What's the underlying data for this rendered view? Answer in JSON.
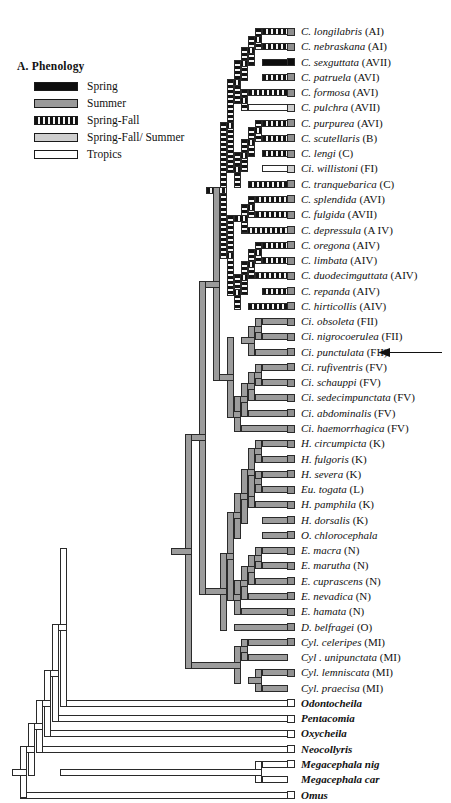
{
  "figure": {
    "panel_label": "A. Phenology"
  },
  "legend": {
    "title": "A. Phenology",
    "items": [
      {
        "label": "Spring",
        "key": "spring",
        "color": "#0d0d0d"
      },
      {
        "label": "Summer",
        "key": "summer",
        "color": "#9a9a9a"
      },
      {
        "label": "Spring-Fall",
        "key": "sf",
        "color": "#111111"
      },
      {
        "label": "Spring-Fall/ Summer",
        "key": "sfs",
        "color": "#cfcfcf"
      },
      {
        "label": "Tropics",
        "key": "trop",
        "color": "#ffffff"
      }
    ]
  },
  "annotation": {
    "arrow_target": "Ci. punctulata (FII)",
    "arrow_icon": "left-arrow-icon"
  },
  "chart_data": {
    "type": "tree",
    "title": "A. Phenology",
    "states": [
      "Spring",
      "Summer",
      "Spring-Fall",
      "Spring-Fall/ Summer",
      "Tropics"
    ],
    "taxa": [
      {
        "genus": "C.",
        "species": "longilabris",
        "code": "(AI)",
        "box": "summer",
        "bold": false
      },
      {
        "genus": "C.",
        "species": "nebraskana",
        "code": "(AI)",
        "box": "summer",
        "bold": false
      },
      {
        "genus": "C.",
        "species": "sexguttata",
        "code": "(AVII)",
        "box": "spring",
        "bold": false
      },
      {
        "genus": "C.",
        "species": "patruela",
        "code": "(AVI)",
        "box": "summer",
        "bold": false
      },
      {
        "genus": "C.",
        "species": "formosa",
        "code": "(AVI)",
        "box": "summer",
        "bold": false
      },
      {
        "genus": "C.",
        "species": "pulchra",
        "code": "(AVII)",
        "box": "sfs",
        "bold": false
      },
      {
        "genus": "C.",
        "species": "purpurea",
        "code": "(AVI)",
        "box": "summer",
        "bold": false
      },
      {
        "genus": "C.",
        "species": "scutellaris",
        "code": "(B)",
        "box": "summer",
        "bold": false
      },
      {
        "genus": "C.",
        "species": "lengi",
        "code": "(C)",
        "box": "summer",
        "bold": false
      },
      {
        "genus": "Ci.",
        "species": "willistoni",
        "code": "(FI)",
        "box": "sfs",
        "bold": false
      },
      {
        "genus": "C.",
        "species": "tranquebarica",
        "code": "(C)",
        "box": "summer",
        "bold": false
      },
      {
        "genus": "C.",
        "species": "splendida",
        "code": "(AVI)",
        "box": "summer",
        "bold": false
      },
      {
        "genus": "C.",
        "species": "fulgida",
        "code": "(AVII)",
        "box": "summer",
        "bold": false
      },
      {
        "genus": "C.",
        "species": "depressula",
        "code": "(A IV)",
        "box": "summer",
        "bold": false
      },
      {
        "genus": "C.",
        "species": "oregona",
        "code": "(AIV)",
        "box": "summer",
        "bold": false
      },
      {
        "genus": "C.",
        "species": "limbata",
        "code": "(AIV)",
        "box": "summer",
        "bold": false
      },
      {
        "genus": "C.",
        "species": "duodecimguttata",
        "code": "(AIV)",
        "box": "summer",
        "bold": false
      },
      {
        "genus": "C.",
        "species": "repanda",
        "code": "(AIV)",
        "box": "summer",
        "bold": false
      },
      {
        "genus": "C.",
        "species": "hirticollis",
        "code": "(AIV)",
        "box": "summer",
        "bold": false
      },
      {
        "genus": "Ci.",
        "species": "obsoleta",
        "code": "(FII)",
        "box": "summer",
        "bold": false
      },
      {
        "genus": "Ci.",
        "species": "nigrocoerulea",
        "code": "(FII)",
        "box": "summer",
        "bold": false
      },
      {
        "genus": "Ci.",
        "species": "punctulata",
        "code": "(FII)",
        "box": "summer",
        "bold": false
      },
      {
        "genus": "Ci.",
        "species": "rufiventris",
        "code": "(FV)",
        "box": "summer",
        "bold": false
      },
      {
        "genus": "Ci.",
        "species": "schauppi",
        "code": "(FV)",
        "box": "summer",
        "bold": false
      },
      {
        "genus": "Ci.",
        "species": "sedecimpunctata",
        "code": "(FV)",
        "box": "summer",
        "bold": false
      },
      {
        "genus": "Ci.",
        "species": "abdominalis",
        "code": "(FV)",
        "box": "summer",
        "bold": false
      },
      {
        "genus": "Ci.",
        "species": "haemorrhagica",
        "code": "(FV)",
        "box": "summer",
        "bold": false
      },
      {
        "genus": "H.",
        "species": "circumpicta",
        "code": "(K)",
        "box": "summer",
        "bold": false
      },
      {
        "genus": "H.",
        "species": "fulgoris",
        "code": "(K)",
        "box": "summer",
        "bold": false
      },
      {
        "genus": "H.",
        "species": "severa",
        "code": "(K)",
        "box": "summer",
        "bold": false
      },
      {
        "genus": "Eu.",
        "species": "togata",
        "code": "(L)",
        "box": "summer",
        "bold": false
      },
      {
        "genus": "H.",
        "species": "pamphila",
        "code": "(K)",
        "box": "summer",
        "bold": false
      },
      {
        "genus": "H.",
        "species": "dorsalis",
        "code": "(K)",
        "box": "summer",
        "bold": false
      },
      {
        "genus": "O.",
        "species": "chlorocephala",
        "code": "",
        "box": "summer",
        "bold": false
      },
      {
        "genus": "E.",
        "species": "macra",
        "code": "(N)",
        "box": "summer",
        "bold": false
      },
      {
        "genus": "E.",
        "species": "marutha",
        "code": "(N)",
        "box": "summer",
        "bold": false
      },
      {
        "genus": "E.",
        "species": "cuprascens",
        "code": "(N)",
        "box": "summer",
        "bold": false
      },
      {
        "genus": "E.",
        "species": "nevadica",
        "code": "(N)",
        "box": "summer",
        "bold": false
      },
      {
        "genus": "E.",
        "species": "hamata",
        "code": "(N)",
        "box": "summer",
        "bold": false
      },
      {
        "genus": "D.",
        "species": "belfragei",
        "code": "(O)",
        "box": "summer",
        "bold": false
      },
      {
        "genus": "Cyl.",
        "species": "celeripes",
        "code": "(MI)",
        "box": "summer",
        "bold": false
      },
      {
        "genus": "Cyl .",
        "species": "unipunctata",
        "code": "(MI)",
        "box": "none",
        "bold": false
      },
      {
        "genus": "Cyl.",
        "species": "lemniscata",
        "code": "(MI)",
        "box": "summer",
        "bold": false
      },
      {
        "genus": "Cyl.",
        "species": "praecisa",
        "code": "(MI)",
        "box": "none",
        "bold": false
      },
      {
        "genus": "",
        "species": "Odontocheila",
        "code": "",
        "box": "trop",
        "bold": true
      },
      {
        "genus": "",
        "species": "Pentacomia",
        "code": "",
        "box": "trop",
        "bold": true
      },
      {
        "genus": "",
        "species": "Oxycheila",
        "code": "",
        "box": "trop",
        "bold": true
      },
      {
        "genus": "",
        "species": "Neocollyris",
        "code": "",
        "box": "trop",
        "bold": true
      },
      {
        "genus": "",
        "species": "Megacephala nig",
        "code": "",
        "box": "trop",
        "bold": true
      },
      {
        "genus": "",
        "species": "Megacephala car",
        "code": "",
        "box": "none",
        "bold": true
      },
      {
        "genus": "",
        "species": "Omus",
        "code": "",
        "box": "trop",
        "bold": true
      }
    ]
  }
}
